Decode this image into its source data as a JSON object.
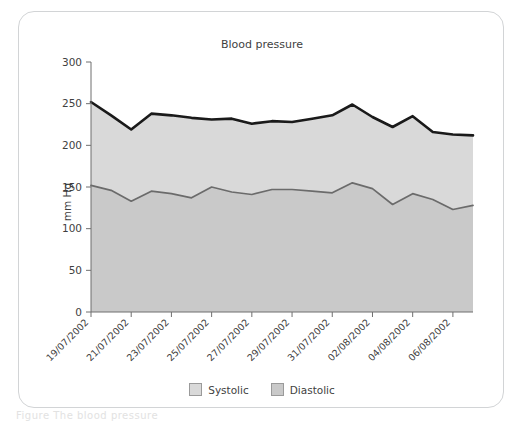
{
  "figure": {
    "caption_faint": "Figure  The blood pressure"
  },
  "legend": {
    "position": "bottom-center",
    "items": [
      {
        "label": "Systolic",
        "color": "#d9d9d9",
        "swatch_name": "legend-swatch-systolic"
      },
      {
        "label": "Diastolic",
        "color": "#c9c9c9",
        "swatch_name": "legend-swatch-diastolic"
      }
    ]
  },
  "chart_data": {
    "type": "area",
    "title": "Blood pressure",
    "xlabel": "",
    "ylabel": "mm Hg",
    "ylim": [
      0,
      300
    ],
    "yticks": [
      0,
      50,
      100,
      150,
      200,
      250,
      300
    ],
    "grid": false,
    "x": [
      "19/07/2002",
      "20/07/2002",
      "21/07/2002",
      "22/07/2002",
      "23/07/2002",
      "24/07/2002",
      "25/07/2002",
      "26/07/2002",
      "27/07/2002",
      "28/07/2002",
      "29/07/2002",
      "30/07/2002",
      "31/07/2002",
      "01/08/2002",
      "02/08/2002",
      "03/08/2002",
      "04/08/2002",
      "05/08/2002",
      "06/08/2002",
      "07/08/2002"
    ],
    "xtick_labels": [
      "19/07/2002",
      "21/07/2002",
      "23/07/2002",
      "25/07/2002",
      "27/07/2002",
      "29/07/2002",
      "31/07/2002",
      "02/08/2002",
      "04/08/2002",
      "06/08/2002"
    ],
    "series": [
      {
        "name": "Systolic",
        "color": "#d9d9d9",
        "line_color": "#1a1a1a",
        "values": [
          252,
          236,
          219,
          238,
          236,
          233,
          231,
          232,
          226,
          229,
          228,
          232,
          236,
          249,
          234,
          222,
          235,
          216,
          213,
          212
        ]
      },
      {
        "name": "Diastolic",
        "color": "#c9c9c9",
        "line_color": "#6b6b6b",
        "values": [
          152,
          146,
          133,
          145,
          142,
          137,
          150,
          144,
          141,
          147,
          147,
          145,
          143,
          155,
          148,
          129,
          142,
          135,
          123,
          128
        ]
      }
    ]
  }
}
